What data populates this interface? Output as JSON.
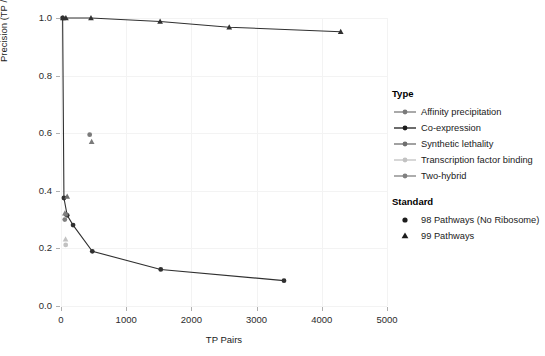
{
  "chart_data": {
    "type": "scatter",
    "title": "",
    "xlabel": "TP Pairs",
    "ylabel": "Precision (TP / [TP + FP])",
    "xlim": [
      0,
      5000
    ],
    "ylim": [
      0.0,
      1.0
    ],
    "xticks": [
      0,
      1000,
      2000,
      3000,
      4000,
      5000
    ],
    "xtick_labels": [
      "0",
      "1000",
      "2000",
      "3000",
      "4000",
      "5000"
    ],
    "yticks": [
      0.0,
      0.2,
      0.4,
      0.6,
      0.8,
      1.0
    ],
    "ytick_labels": [
      "0.0",
      "0.2",
      "0.4",
      "0.6",
      "0.8",
      "1.0"
    ],
    "grid": true,
    "legend_position": "right",
    "series": [
      {
        "name": "Co-expression",
        "standard": "99 Pathways",
        "marker": "triangle",
        "color": "#303030",
        "points": [
          {
            "x": 30,
            "y": 1.0
          },
          {
            "x": 75,
            "y": 1.0
          },
          {
            "x": 460,
            "y": 1.0
          },
          {
            "x": 1520,
            "y": 0.988
          },
          {
            "x": 2580,
            "y": 0.968
          },
          {
            "x": 4290,
            "y": 0.952
          }
        ]
      },
      {
        "name": "Co-expression",
        "standard": "98 Pathways (No Ribosome)",
        "marker": "circle",
        "color": "#303030",
        "points": [
          {
            "x": 25,
            "y": 1.0
          },
          {
            "x": 45,
            "y": 0.375
          },
          {
            "x": 95,
            "y": 0.315
          },
          {
            "x": 185,
            "y": 0.281
          },
          {
            "x": 480,
            "y": 0.19
          },
          {
            "x": 1530,
            "y": 0.127
          },
          {
            "x": 3420,
            "y": 0.088
          }
        ]
      },
      {
        "name": "Affinity precipitation",
        "standard": "98 Pathways (No Ribosome)",
        "marker": "circle",
        "color": "#7a7a7a",
        "points": [
          {
            "x": 440,
            "y": 0.595
          }
        ]
      },
      {
        "name": "Affinity precipitation",
        "standard": "99 Pathways",
        "marker": "triangle",
        "color": "#7a7a7a",
        "points": [
          {
            "x": 470,
            "y": 0.57
          }
        ]
      },
      {
        "name": "Synthetic lethality",
        "standard": "99 Pathways",
        "marker": "triangle",
        "color": "#6f6f6f",
        "points": [
          {
            "x": 95,
            "y": 0.38
          }
        ]
      },
      {
        "name": "Synthetic lethality",
        "standard": "98 Pathways (No Ribosome)",
        "marker": "circle",
        "color": "#6f6f6f",
        "points": [
          {
            "x": 75,
            "y": 0.318
          }
        ]
      },
      {
        "name": "Two-hybrid",
        "standard": "99 Pathways",
        "marker": "triangle",
        "color": "#808080",
        "points": [
          {
            "x": 60,
            "y": 0.322
          }
        ]
      },
      {
        "name": "Two-hybrid",
        "standard": "98 Pathways (No Ribosome)",
        "marker": "circle",
        "color": "#808080",
        "points": [
          {
            "x": 58,
            "y": 0.3
          }
        ]
      },
      {
        "name": "Transcription factor binding",
        "standard": "99 Pathways",
        "marker": "triangle",
        "color": "#c2c2c2",
        "points": [
          {
            "x": 70,
            "y": 0.232
          }
        ]
      },
      {
        "name": "Transcription factor binding",
        "standard": "98 Pathways (No Ribosome)",
        "marker": "circle",
        "color": "#c2c2c2",
        "points": [
          {
            "x": 72,
            "y": 0.212
          }
        ]
      }
    ]
  },
  "axes": {
    "x_title": "TP Pairs",
    "y_title": "Precision (TP / [TP + FP])"
  },
  "legend": {
    "type": {
      "title": "Type",
      "items": [
        {
          "label": "Affinity precipitation",
          "color": "#7a7a7a"
        },
        {
          "label": "Co-expression",
          "color": "#1c1c1c"
        },
        {
          "label": "Synthetic lethality",
          "color": "#6f6f6f"
        },
        {
          "label": "Transcription factor binding",
          "color": "#c2c2c2"
        },
        {
          "label": "Two-hybrid",
          "color": "#808080"
        }
      ]
    },
    "standard": {
      "title": "Standard",
      "items": [
        {
          "label": "98 Pathways (No Ribosome)",
          "marker": "circle"
        },
        {
          "label": "99 Pathways",
          "marker": "triangle"
        }
      ]
    }
  }
}
